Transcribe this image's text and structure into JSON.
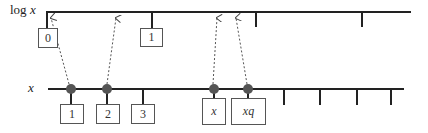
{
  "diagram": {
    "title": "",
    "axes": {
      "log_axis": {
        "label_prefix": "log ",
        "label_var": "x"
      },
      "linear_axis": {
        "label": "x"
      }
    },
    "log_axis_boxes": [
      {
        "label": "0",
        "x": 38,
        "y": 28,
        "w": 20,
        "h": 20
      },
      {
        "label": "1",
        "x": 140,
        "y": 28,
        "w": 23,
        "h": 19
      }
    ],
    "log_axis_ticks_x": [
      152,
      256,
      362
    ],
    "linear_axis_boxes": [
      {
        "label": "1",
        "x": 60,
        "y": 104,
        "w": 24,
        "h": 20,
        "italic": false
      },
      {
        "label": "2",
        "x": 96,
        "y": 104,
        "w": 24,
        "h": 20,
        "italic": false
      },
      {
        "label": "3",
        "x": 131,
        "y": 104,
        "w": 24,
        "h": 20,
        "italic": false
      },
      {
        "label": "x",
        "x": 202,
        "y": 98,
        "w": 24,
        "h": 27,
        "italic": true
      },
      {
        "label": "xq",
        "x": 231,
        "y": 98,
        "w": 35,
        "h": 27,
        "italic": true
      }
    ],
    "linear_axis_points_x": [
      71,
      107,
      214,
      248
    ],
    "linear_axis_ticks_x": [
      143,
      284,
      320,
      357,
      391
    ],
    "mapping_arrows": [
      {
        "from_x": 71,
        "to_x": 51
      },
      {
        "from_x": 107,
        "to_x": 116
      },
      {
        "from_x": 214,
        "to_x": 217
      },
      {
        "from_x": 248,
        "to_x": 236
      }
    ],
    "colors": {
      "line": "#222222",
      "point": "#555555",
      "arrow": "#555555",
      "box_border": "#555555"
    }
  }
}
